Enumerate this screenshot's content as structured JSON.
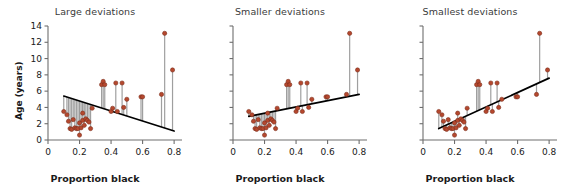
{
  "figure": {
    "ylabel": "Age (years)",
    "xlabel": "Proportion black",
    "marker_color": "#b5482e",
    "marker_edge": "#7d2f1c",
    "line_color": "#000000",
    "residual_color": "#9a9a9a",
    "axis_color": "#6e6e6e"
  },
  "chart_data": [
    {
      "type": "scatter",
      "title": "Large deviations",
      "xlabel": "Proportion black",
      "ylabel": "Age (years)",
      "xlim": [
        0,
        0.85
      ],
      "ylim": [
        0,
        14
      ],
      "xticks": [
        0,
        0.2,
        0.4,
        0.6,
        0.8
      ],
      "xticklabels": [
        "0",
        "0.2",
        "0.4",
        "0.6",
        "0.8"
      ],
      "yticks": [
        0,
        2,
        4,
        6,
        8,
        10,
        12,
        14
      ],
      "yticklabels": [
        "0",
        "2",
        "4",
        "6",
        "8",
        "10",
        "12",
        "14"
      ],
      "grid": false,
      "legend": "none",
      "fit_line": {
        "x0": 0.1,
        "y0": 5.4,
        "x1": 0.8,
        "y1": 1.1
      },
      "x": [
        0.1,
        0.12,
        0.13,
        0.14,
        0.15,
        0.16,
        0.17,
        0.18,
        0.19,
        0.2,
        0.2,
        0.21,
        0.22,
        0.22,
        0.23,
        0.24,
        0.25,
        0.26,
        0.27,
        0.28,
        0.34,
        0.35,
        0.36,
        0.4,
        0.41,
        0.43,
        0.44,
        0.47,
        0.48,
        0.5,
        0.59,
        0.6,
        0.72,
        0.74,
        0.79
      ],
      "y": [
        3.5,
        3.1,
        2.3,
        1.4,
        1.3,
        2.5,
        1.5,
        1.4,
        1.4,
        0.6,
        2.1,
        1.5,
        2.4,
        3.3,
        1.8,
        2.6,
        2.4,
        2.2,
        1.4,
        3.9,
        6.8,
        7.2,
        6.8,
        3.5,
        3.9,
        7.0,
        3.5,
        7.0,
        4.0,
        5.0,
        5.3,
        5.3,
        5.6,
        13.1,
        8.6
      ]
    },
    {
      "type": "scatter",
      "title": "Smaller deviations",
      "xlabel": "Proportion black",
      "ylabel": "Age (years)",
      "xlim": [
        0,
        0.85
      ],
      "ylim": [
        0,
        14
      ],
      "xticks": [
        0,
        0.2,
        0.4,
        0.6,
        0.8
      ],
      "xticklabels": [
        "0",
        "0.2",
        "0.4",
        "0.6",
        "0.8"
      ],
      "yticks": [
        0,
        2,
        4,
        6,
        8,
        10,
        12,
        14
      ],
      "yticklabels": [
        "0",
        "2",
        "4",
        "6",
        "8",
        "10",
        "12",
        "14"
      ],
      "grid": false,
      "legend": "none",
      "fit_line": {
        "x0": 0.1,
        "y0": 2.9,
        "x1": 0.8,
        "y1": 5.6
      },
      "x": [
        0.1,
        0.12,
        0.13,
        0.14,
        0.15,
        0.16,
        0.17,
        0.18,
        0.19,
        0.2,
        0.2,
        0.21,
        0.22,
        0.22,
        0.23,
        0.24,
        0.25,
        0.26,
        0.27,
        0.28,
        0.34,
        0.35,
        0.36,
        0.4,
        0.41,
        0.43,
        0.44,
        0.47,
        0.48,
        0.5,
        0.59,
        0.6,
        0.72,
        0.74,
        0.79
      ],
      "y": [
        3.5,
        3.1,
        2.3,
        1.4,
        1.3,
        2.5,
        1.5,
        1.4,
        1.4,
        0.6,
        2.1,
        1.5,
        2.4,
        3.3,
        1.8,
        2.6,
        2.4,
        2.2,
        1.4,
        3.9,
        6.8,
        7.2,
        6.8,
        3.5,
        3.9,
        7.0,
        3.5,
        7.0,
        4.0,
        5.0,
        5.3,
        5.3,
        5.6,
        13.1,
        8.6
      ]
    },
    {
      "type": "scatter",
      "title": "Smallest deviations",
      "xlabel": "Proportion black",
      "ylabel": "Age (years)",
      "xlim": [
        0,
        0.85
      ],
      "ylim": [
        0,
        14
      ],
      "xticks": [
        0,
        0.2,
        0.4,
        0.6,
        0.8
      ],
      "xticklabels": [
        "0",
        "0.2",
        "0.4",
        "0.6",
        "0.8"
      ],
      "yticks": [
        0,
        2,
        4,
        6,
        8,
        10,
        12,
        14
      ],
      "yticklabels": [
        "0",
        "2",
        "4",
        "6",
        "8",
        "10",
        "12",
        "14"
      ],
      "grid": false,
      "legend": "none",
      "fit_line": {
        "x0": 0.1,
        "y0": 1.4,
        "x1": 0.8,
        "y1": 7.6
      },
      "x": [
        0.1,
        0.12,
        0.13,
        0.14,
        0.15,
        0.16,
        0.17,
        0.18,
        0.19,
        0.2,
        0.2,
        0.21,
        0.22,
        0.22,
        0.23,
        0.24,
        0.25,
        0.26,
        0.27,
        0.28,
        0.34,
        0.35,
        0.36,
        0.4,
        0.41,
        0.43,
        0.44,
        0.47,
        0.48,
        0.5,
        0.59,
        0.6,
        0.72,
        0.74,
        0.79
      ],
      "y": [
        3.5,
        3.1,
        2.3,
        1.4,
        1.3,
        2.5,
        1.5,
        1.4,
        1.4,
        0.6,
        2.1,
        1.5,
        2.4,
        3.3,
        1.8,
        2.6,
        2.4,
        2.2,
        1.4,
        3.9,
        6.8,
        7.2,
        6.8,
        3.5,
        3.9,
        7.0,
        3.5,
        7.0,
        4.0,
        5.0,
        5.3,
        5.3,
        5.6,
        13.1,
        8.6
      ]
    }
  ]
}
